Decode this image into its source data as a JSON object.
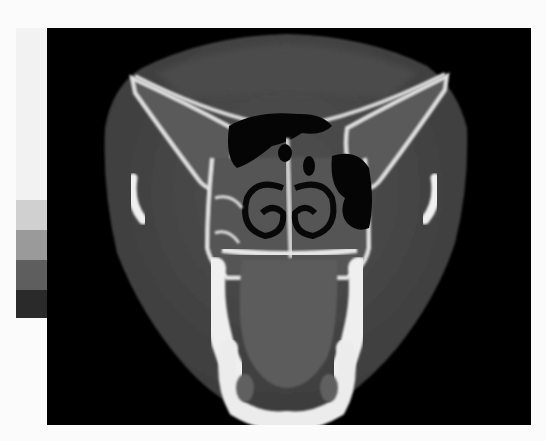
{
  "image": {
    "description": "Coronal CT slice of skull through orbits, maxillary sinuses, nasal cavity and mandible",
    "view": "coronal",
    "modality": "CT"
  },
  "calibration_strip": {
    "steps": [
      {
        "color": "#f2f2f2",
        "height": 172
      },
      {
        "color": "#d0d0d0",
        "height": 30
      },
      {
        "color": "#9a9a9a",
        "height": 30
      },
      {
        "color": "#5e5e5e",
        "height": 30
      },
      {
        "color": "#2a2a2a",
        "height": 28
      }
    ]
  },
  "colors": {
    "background": "#fbfbfb",
    "panel": "#000000",
    "soft_tissue": "#4a4a4a",
    "soft_tissue_dark": "#3a3a3a",
    "bone": "#e8e8e8",
    "air": "#050505",
    "tongue": "#5a5a5a"
  }
}
